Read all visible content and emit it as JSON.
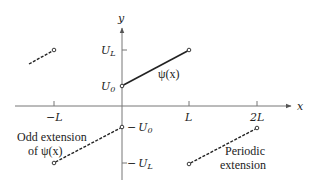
{
  "figure": {
    "axes": {
      "x_label": "x",
      "y_label": "y",
      "x_ticks": [
        {
          "label": "−L",
          "value": "-L"
        },
        {
          "label": "L",
          "value": "L"
        },
        {
          "label": "2L",
          "value": "2L"
        }
      ],
      "y_ticks": [
        {
          "label_main": "U",
          "label_sub": "L",
          "prefix": "",
          "value": "U_L"
        },
        {
          "label_main": "U",
          "label_sub": "0",
          "prefix": "",
          "value": "U_0"
        },
        {
          "label_main": "U",
          "label_sub": "0",
          "prefix": "−",
          "value": "-U_0"
        },
        {
          "label_main": "U",
          "label_sub": "L",
          "prefix": "−",
          "value": "-U_L"
        }
      ]
    },
    "curves": {
      "main": {
        "label": "ψ(x)",
        "style": "solid"
      },
      "odd_extension": {
        "label_line1": "Odd extension",
        "label_line2": "of ψ(x)",
        "style": "dashed"
      },
      "periodic_extension": {
        "label_line1": "Periodic",
        "label_line2": "extension",
        "style": "dashed"
      },
      "periodic_left": {
        "style": "dashed"
      }
    },
    "colors": {
      "axis": "#777777",
      "line": "#222222"
    }
  }
}
